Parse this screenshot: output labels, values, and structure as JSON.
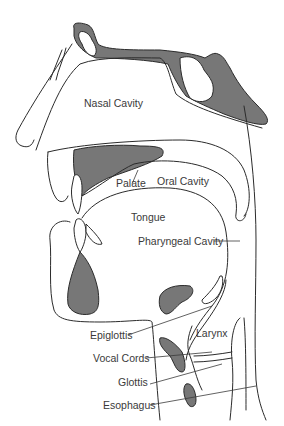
{
  "figure": {
    "colors": {
      "tissue_fill": "#777777",
      "line": "#2b2b2b",
      "background": "#ffffff"
    }
  },
  "labels": {
    "nasal_cavity": "Nasal Cavity",
    "palate": "Palate",
    "oral_cavity": "Oral Cavity",
    "tongue": "Tongue",
    "pharyngeal_cavity": "Pharyngeal Cavity",
    "epiglottis": "Epiglottis",
    "larynx": "Larynx",
    "vocal_cords": "Vocal Cords",
    "glottis": "Glottis",
    "esophagus": "Esophagus"
  }
}
